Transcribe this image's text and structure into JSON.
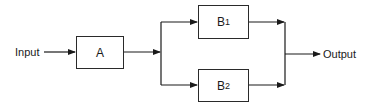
{
  "diagram": {
    "input_label": "Input",
    "output_label": "Output",
    "blocks": [
      {
        "id": "A",
        "label": "A",
        "sub": ""
      },
      {
        "id": "B1",
        "label": "B",
        "sub": "1"
      },
      {
        "id": "B2",
        "label": "B",
        "sub": "2"
      }
    ],
    "connections": [
      {
        "from": "Input",
        "to": "A"
      },
      {
        "from": "A",
        "to": "B1"
      },
      {
        "from": "A",
        "to": "B2"
      },
      {
        "from": "B1",
        "to": "Output"
      },
      {
        "from": "B2",
        "to": "Output"
      }
    ],
    "line_color": "#1a1a1a"
  }
}
